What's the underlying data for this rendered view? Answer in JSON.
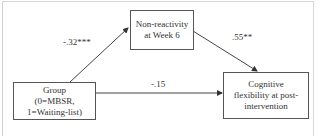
{
  "diagram": {
    "type": "mediation-path-diagram",
    "nodes": {
      "mediator": {
        "lines": [
          "Non-reactivity",
          "at Week 6"
        ]
      },
      "predictor": {
        "lines": [
          "Group",
          "(0=MBSR,",
          "1=Waiting-list)"
        ]
      },
      "outcome": {
        "lines": [
          "Cognitive",
          "flexibility at post-",
          "intervention"
        ]
      }
    },
    "edges": {
      "a_path": {
        "from": "predictor",
        "to": "mediator",
        "coefficient": "-.32***"
      },
      "b_path": {
        "from": "mediator",
        "to": "outcome",
        "coefficient": ".55**"
      },
      "c_prime_path": {
        "from": "predictor",
        "to": "outcome",
        "coefficient": "-.15"
      }
    },
    "colors": {
      "line": "#444444",
      "box_border": "#555555",
      "frame": "#d0d0d0",
      "text": "#333333"
    }
  }
}
